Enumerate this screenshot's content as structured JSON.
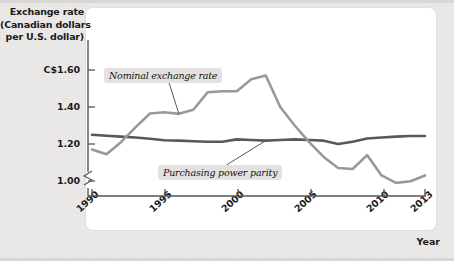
{
  "figure": {
    "y_axis_title_lines": [
      "Exchange rate",
      "(Canadian dollars",
      "per U.S. dollar)"
    ],
    "x_axis_title": "Year"
  },
  "axes": {
    "y_ticks": [
      "C$1.60",
      "1.40",
      "1.20",
      "1.00"
    ],
    "y_tick_values": [
      1.6,
      1.4,
      1.2,
      1.0
    ],
    "x_ticks": [
      "1990",
      "1995",
      "2000",
      "2005",
      "2010",
      "2013"
    ],
    "x_tick_values": [
      1990,
      1995,
      2000,
      2005,
      2010,
      2013
    ],
    "axis_break": true
  },
  "series_labels": {
    "nominal": "Nominal exchange rate",
    "ppp": "Purchasing power parity"
  },
  "colors": {
    "nominal_line": "#999999",
    "ppp_line": "#595959",
    "panel_background": "#ffffff",
    "mat_background": "#eceae8",
    "label_background": "#e4e2e0",
    "text": "#1b1b1b"
  },
  "chart_data": {
    "type": "line",
    "title": "",
    "subtitle": "",
    "xlabel": "Year",
    "ylabel": "Exchange rate (Canadian dollars per U.S. dollar)",
    "xlim": [
      1990,
      2013
    ],
    "ylim": [
      0.94,
      1.68
    ],
    "ytick_labels": [
      "C$1.60",
      "1.40",
      "1.20",
      "1.00"
    ],
    "ytick_values": [
      1.6,
      1.4,
      1.2,
      1.0
    ],
    "xtick_values": [
      1990,
      1995,
      2000,
      2005,
      2010,
      2013
    ],
    "grid": false,
    "legend": "inline-annotations",
    "axis_break_y_below": 1.0,
    "x": [
      1990,
      1991,
      1992,
      1993,
      1994,
      1995,
      1996,
      1997,
      1998,
      1999,
      2000,
      2001,
      2002,
      2003,
      2004,
      2005,
      2006,
      2007,
      2008,
      2009,
      2010,
      2011,
      2012,
      2013
    ],
    "series": [
      {
        "name": "Nominal exchange rate",
        "color": "#999999",
        "values": [
          1.17,
          1.145,
          1.21,
          1.29,
          1.365,
          1.372,
          1.363,
          1.385,
          1.48,
          1.485,
          1.485,
          1.55,
          1.57,
          1.4,
          1.3,
          1.21,
          1.13,
          1.07,
          1.065,
          1.14,
          1.03,
          0.99,
          0.999,
          1.03
        ]
      },
      {
        "name": "Purchasing power parity",
        "color": "#595959",
        "values": [
          1.25,
          1.245,
          1.24,
          1.235,
          1.228,
          1.22,
          1.218,
          1.215,
          1.212,
          1.212,
          1.225,
          1.222,
          1.218,
          1.222,
          1.225,
          1.222,
          1.218,
          1.2,
          1.212,
          1.23,
          1.235,
          1.24,
          1.243,
          1.243
        ]
      }
    ],
    "annotations": [
      {
        "text": "Nominal exchange rate",
        "points_to_series": "Nominal exchange rate",
        "points_to_x": 1996
      },
      {
        "text": "Purchasing power parity",
        "points_to_series": "Purchasing power parity",
        "points_to_x": 2002
      }
    ]
  }
}
